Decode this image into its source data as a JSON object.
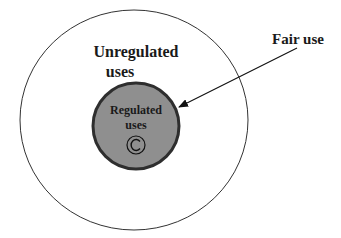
{
  "diagram": {
    "outer_label_line1": "Unregulated",
    "outer_label_line2": "uses",
    "inner_label_line1": "Regulated",
    "inner_label_line2": "uses",
    "inner_symbol": "©",
    "pointer_label": "Fair use",
    "colors": {
      "inner_fill": "#8f8f8f",
      "inner_stroke": "#2e2e2e",
      "outer_stroke": "#333333",
      "text": "#1a1a1a"
    }
  }
}
